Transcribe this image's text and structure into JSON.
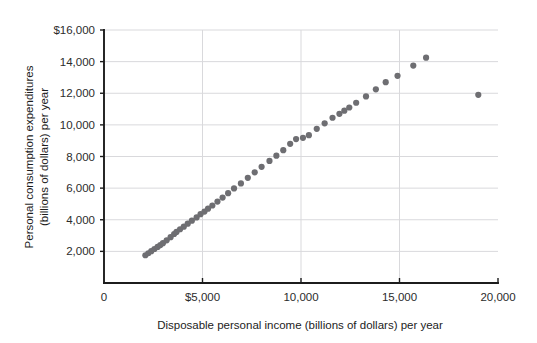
{
  "chart_data": {
    "type": "scatter",
    "title": "",
    "xlabel": "Disposable personal income (billions of dollars) per year",
    "ylabel_line1": "Personal consumption expenditures",
    "ylabel_line2": "(billions of dollars) per year",
    "xlim": [
      0,
      20000
    ],
    "ylim": [
      0,
      16000
    ],
    "xticks": [
      0,
      5000,
      10000,
      15000,
      20000
    ],
    "xtick_labels": [
      "0",
      "$5,000",
      "10,000",
      "15,000",
      "20,000"
    ],
    "yticks": [
      2000,
      4000,
      6000,
      8000,
      10000,
      12000,
      14000,
      16000
    ],
    "ytick_labels": [
      "2,000",
      "4,000",
      "6,000",
      "8,000",
      "10,000",
      "12,000",
      "14,000",
      "$16,000"
    ],
    "grid": "both-axes-light-gray",
    "legend": "none",
    "marker_color": "#6e6e72",
    "marker_size_px": 5,
    "points": [
      [
        2100,
        1755
      ],
      [
        2250,
        1880
      ],
      [
        2400,
        2010
      ],
      [
        2560,
        2150
      ],
      [
        2720,
        2280
      ],
      [
        2860,
        2400
      ],
      [
        2990,
        2520
      ],
      [
        3180,
        2700
      ],
      [
        3380,
        2900
      ],
      [
        3560,
        3100
      ],
      [
        3680,
        3230
      ],
      [
        3860,
        3400
      ],
      [
        4050,
        3560
      ],
      [
        4250,
        3750
      ],
      [
        4460,
        3940
      ],
      [
        4700,
        4150
      ],
      [
        4900,
        4350
      ],
      [
        5100,
        4520
      ],
      [
        5280,
        4700
      ],
      [
        5500,
        4900
      ],
      [
        5760,
        5150
      ],
      [
        6020,
        5400
      ],
      [
        6300,
        5680
      ],
      [
        6600,
        5980
      ],
      [
        6950,
        6300
      ],
      [
        7300,
        6650
      ],
      [
        7650,
        7000
      ],
      [
        8000,
        7350
      ],
      [
        8400,
        7720
      ],
      [
        8750,
        8050
      ],
      [
        9100,
        8400
      ],
      [
        9450,
        8800
      ],
      [
        9750,
        9100
      ],
      [
        10100,
        9180
      ],
      [
        10400,
        9350
      ],
      [
        10800,
        9750
      ],
      [
        11200,
        10100
      ],
      [
        11600,
        10450
      ],
      [
        11950,
        10700
      ],
      [
        12200,
        10900
      ],
      [
        12450,
        11100
      ],
      [
        12800,
        11400
      ],
      [
        13300,
        11800
      ],
      [
        13800,
        12250
      ],
      [
        14300,
        12700
      ],
      [
        14900,
        13100
      ],
      [
        15700,
        13750
      ],
      [
        16350,
        14250
      ],
      [
        19000,
        11900
      ]
    ]
  }
}
